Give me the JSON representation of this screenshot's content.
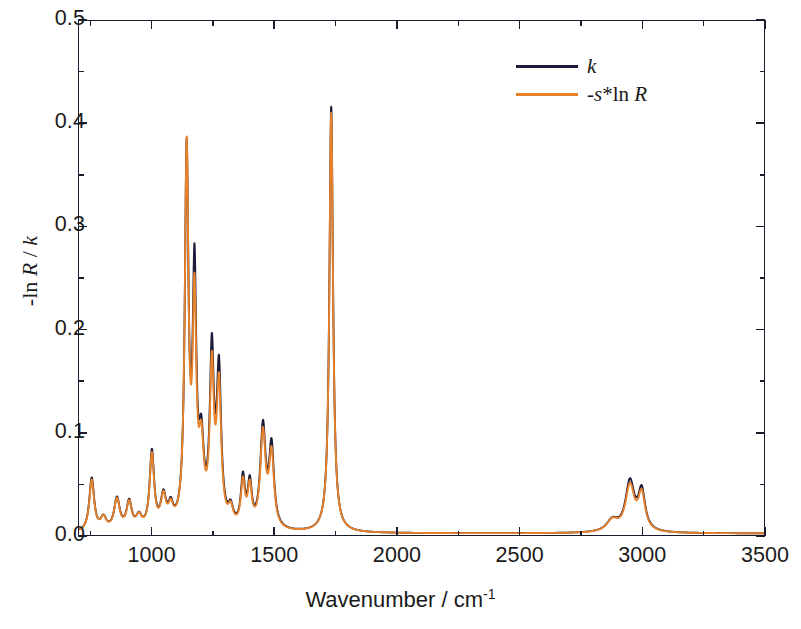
{
  "figure": {
    "x_axis_title_main": "Wavenumber / cm",
    "x_axis_title_sup": "-1",
    "y_axis_title_parts": [
      "-ln ",
      "R",
      " / ",
      "k"
    ]
  },
  "legend": {
    "position": "top-right",
    "entries": [
      {
        "name": "k-curve",
        "label": "k",
        "color": "#1b1b3a"
      },
      {
        "name": "minus-s-ln-R-curve",
        "label": "-s*ln R",
        "color": "#E8822A"
      }
    ]
  },
  "chart_data": {
    "type": "line",
    "title": "",
    "xlabel": "Wavenumber / cm-1",
    "ylabel": "-ln R / k",
    "xlim": [
      700,
      3500
    ],
    "ylim": [
      0.0,
      0.5
    ],
    "x_ticks": [
      1000,
      1500,
      2000,
      2500,
      3000,
      3500
    ],
    "x_minor_ticks": [
      750,
      1250,
      1750,
      2250,
      2750,
      3250
    ],
    "y_ticks": [
      0.0,
      0.1,
      0.2,
      0.3,
      0.4,
      0.5
    ],
    "y_minor_ticks": [
      0.05,
      0.15,
      0.25,
      0.35,
      0.45
    ],
    "grid": false,
    "series": [
      {
        "name": "k",
        "label": "k",
        "color": "#1b1b3a",
        "peaks": [
          {
            "center": 752,
            "height": 0.052,
            "width": 12
          },
          {
            "center": 800,
            "height": 0.012,
            "width": 14
          },
          {
            "center": 855,
            "height": 0.031,
            "width": 14
          },
          {
            "center": 905,
            "height": 0.027,
            "width": 13
          },
          {
            "center": 945,
            "height": 0.012,
            "width": 14
          },
          {
            "center": 998,
            "height": 0.075,
            "width": 11
          },
          {
            "center": 1045,
            "height": 0.03,
            "width": 13
          },
          {
            "center": 1075,
            "height": 0.018,
            "width": 12
          },
          {
            "center": 1140,
            "height": 0.36,
            "width": 9
          },
          {
            "center": 1172,
            "height": 0.238,
            "width": 9
          },
          {
            "center": 1200,
            "height": 0.072,
            "width": 12
          },
          {
            "center": 1243,
            "height": 0.163,
            "width": 10
          },
          {
            "center": 1272,
            "height": 0.148,
            "width": 11
          },
          {
            "center": 1320,
            "height": 0.016,
            "width": 12
          },
          {
            "center": 1370,
            "height": 0.047,
            "width": 10
          },
          {
            "center": 1398,
            "height": 0.041,
            "width": 10
          },
          {
            "center": 1452,
            "height": 0.098,
            "width": 13
          },
          {
            "center": 1487,
            "height": 0.078,
            "width": 12
          },
          {
            "center": 1731,
            "height": 0.415,
            "width": 9
          },
          {
            "center": 2880,
            "height": 0.011,
            "width": 28
          },
          {
            "center": 2952,
            "height": 0.048,
            "width": 22
          },
          {
            "center": 3000,
            "height": 0.038,
            "width": 17
          }
        ]
      },
      {
        "name": "-s*ln R",
        "label": "-s*ln R",
        "color": "#E8822A",
        "peaks": [
          {
            "center": 752,
            "height": 0.05,
            "width": 12
          },
          {
            "center": 800,
            "height": 0.012,
            "width": 14
          },
          {
            "center": 855,
            "height": 0.03,
            "width": 14
          },
          {
            "center": 905,
            "height": 0.026,
            "width": 13
          },
          {
            "center": 945,
            "height": 0.012,
            "width": 14
          },
          {
            "center": 998,
            "height": 0.072,
            "width": 11
          },
          {
            "center": 1045,
            "height": 0.029,
            "width": 13
          },
          {
            "center": 1075,
            "height": 0.017,
            "width": 12
          },
          {
            "center": 1140,
            "height": 0.364,
            "width": 9
          },
          {
            "center": 1172,
            "height": 0.21,
            "width": 9
          },
          {
            "center": 1200,
            "height": 0.07,
            "width": 12
          },
          {
            "center": 1243,
            "height": 0.148,
            "width": 10
          },
          {
            "center": 1272,
            "height": 0.133,
            "width": 11
          },
          {
            "center": 1320,
            "height": 0.016,
            "width": 12
          },
          {
            "center": 1370,
            "height": 0.043,
            "width": 10
          },
          {
            "center": 1398,
            "height": 0.038,
            "width": 10
          },
          {
            "center": 1452,
            "height": 0.092,
            "width": 13
          },
          {
            "center": 1487,
            "height": 0.071,
            "width": 12
          },
          {
            "center": 1731,
            "height": 0.409,
            "width": 9
          },
          {
            "center": 2880,
            "height": 0.011,
            "width": 28
          },
          {
            "center": 2952,
            "height": 0.044,
            "width": 22
          },
          {
            "center": 3000,
            "height": 0.035,
            "width": 17
          }
        ]
      }
    ]
  }
}
